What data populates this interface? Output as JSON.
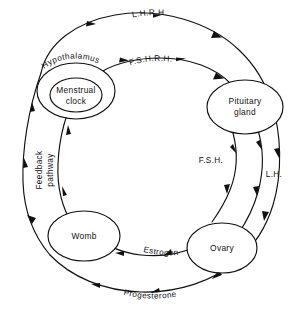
{
  "diagram": {
    "background_color": "#ffffff",
    "line_color": "#111111",
    "nodes": {
      "hypothalamus": {
        "outer_label": "Hypothalamus",
        "inner_label_line1": "Menstrual",
        "inner_label_line2": "clock"
      },
      "pituitary": {
        "label_line1": "Pituitary",
        "label_line2": "gland"
      },
      "ovary": {
        "label": "Ovary"
      },
      "womb": {
        "label": "Womb"
      }
    },
    "pathways": {
      "lhrh": "L.H.R.H.",
      "fshrh": "F.S.H.R.H.",
      "fsh": "F.S.H.",
      "lh": "L.H.",
      "estrogen": "Estrogen",
      "progesterone": "Progesterone",
      "feedback_line1": "Feedback",
      "feedback_line2": "pathway"
    }
  }
}
